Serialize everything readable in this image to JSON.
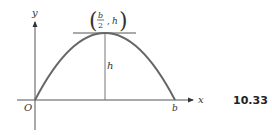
{
  "figure": {
    "number": "10.33",
    "axes": {
      "x_label": "x",
      "y_label": "y",
      "origin_label": "O"
    },
    "curve": {
      "type": "parabola",
      "description": "Downward parabola through O and b with vertex at (b/2, h)",
      "color": "#666666"
    },
    "labels": {
      "root_right": "b",
      "height": "h",
      "vertex_open_paren": "(",
      "vertex_close_paren": ")",
      "vertex_x_numerator": "b",
      "vertex_x_denominator": "2",
      "vertex_separator": ",",
      "vertex_y": "h"
    }
  }
}
